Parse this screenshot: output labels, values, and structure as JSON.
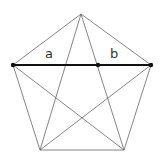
{
  "diagram": {
    "type": "pentagon-with-diagonals",
    "labels": {
      "a": "a",
      "b": "b"
    },
    "colors": {
      "line": "#555555",
      "thick": "#111111",
      "background": "#ffffff"
    },
    "vertices": {
      "top": [
        81,
        14
      ],
      "left": [
        13,
        65
      ],
      "right": [
        151,
        65
      ],
      "bottom_left": [
        40,
        150
      ],
      "bottom_right": [
        124,
        150
      ]
    },
    "division_point": [
      98,
      65
    ]
  }
}
